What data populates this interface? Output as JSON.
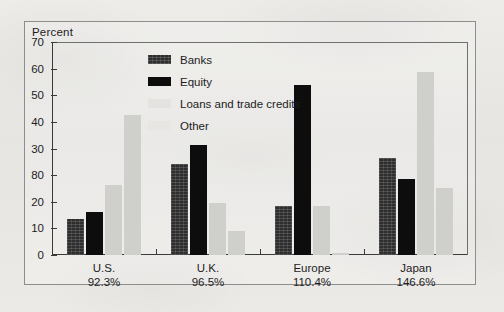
{
  "figure": {
    "frame_border_color": "#8d8d8d",
    "background_color": "#e8e8e6"
  },
  "chart_data": {
    "type": "bar",
    "title": "",
    "subtitle": "",
    "xlabel": "",
    "ylabel": "Percent",
    "ylim": [
      0,
      70
    ],
    "grid": false,
    "legend_position": "inside-top-left",
    "y_tick_labels": [
      "70",
      "60",
      "50",
      "40",
      "30",
      "80",
      "20",
      "10",
      "0"
    ],
    "y_tick_values": [
      70,
      60,
      50,
      40,
      30,
      25,
      20,
      10,
      0
    ],
    "categories": [
      "U.S.",
      "U.K.",
      "Europe",
      "Japan"
    ],
    "category_sublabels": [
      "92.3%",
      "96.5%",
      "110.4%",
      "146.6%"
    ],
    "series": [
      {
        "name": "Banks",
        "color": "#2e2e2e",
        "values": [
          12,
          30,
          16,
          32
        ]
      },
      {
        "name": "Equity",
        "color": "#0d0d0d",
        "values": [
          14,
          36,
          56,
          25
        ]
      },
      {
        "name": "Loans and trade credits",
        "color": "#cfcfcb",
        "values": [
          23,
          17,
          16,
          60
        ]
      },
      {
        "name": "Other",
        "color": "#cfcfcb",
        "values": [
          46,
          8,
          0.5,
          22
        ]
      }
    ]
  },
  "legend": {
    "items": [
      {
        "label": "Banks"
      },
      {
        "label": "Equity"
      },
      {
        "label": "Loans and trade credits"
      },
      {
        "label": "Other"
      }
    ]
  }
}
